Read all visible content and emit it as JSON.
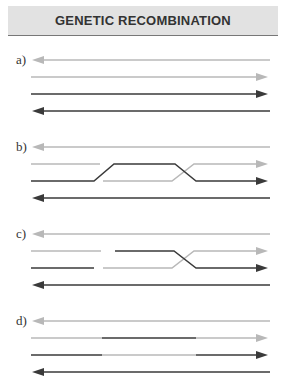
{
  "title": "GENETIC RECOMBINATION",
  "panels": [
    {
      "label": "a)",
      "stage": "two parental DNA duplexes aligned"
    },
    {
      "label": "b)",
      "stage": "strand invasion / crossover"
    },
    {
      "label": "c)",
      "stage": "nicked strands, Holliday junction"
    },
    {
      "label": "d)",
      "stage": "resolved recombinant strands"
    }
  ],
  "colors": {
    "light_strand": "#b8b8b8",
    "dark_strand": "#3a3a3a",
    "header_bg": "#e2e2e2"
  }
}
